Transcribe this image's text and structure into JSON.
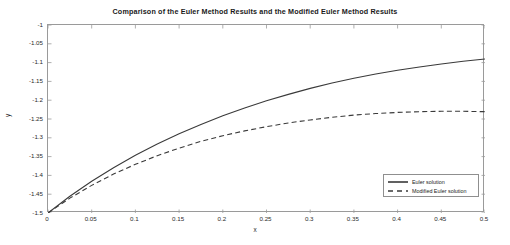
{
  "chart_data": {
    "type": "line",
    "title": "Comparison of the Euler Method Results and the Modified Euler Method Results",
    "xlabel": "x",
    "ylabel": "y",
    "xlim": [
      0,
      0.5
    ],
    "ylim": [
      -1.5,
      -1
    ],
    "grid": false,
    "legend_position": "lower-right",
    "xticks": [
      "0",
      "0.05",
      "0.1",
      "0.15",
      "0.2",
      "0.25",
      "0.3",
      "0.35",
      "0.4",
      "0.45",
      "0.5"
    ],
    "xtick_values": [
      0,
      0.05,
      0.1,
      0.15,
      0.2,
      0.25,
      0.3,
      0.35,
      0.4,
      0.45,
      0.5
    ],
    "yticks": [
      "-1",
      "-1.05",
      "-1.1",
      "-1.15",
      "-1.2",
      "-1.25",
      "-1.3",
      "-1.35",
      "-1.4",
      "-1.45",
      "-1.5"
    ],
    "ytick_values": [
      -1,
      -1.05,
      -1.1,
      -1.15,
      -1.2,
      -1.25,
      -1.3,
      -1.35,
      -1.4,
      -1.45,
      -1.5
    ],
    "x": [
      0,
      0.025,
      0.05,
      0.075,
      0.1,
      0.125,
      0.15,
      0.175,
      0.2,
      0.225,
      0.25,
      0.275,
      0.3,
      0.325,
      0.35,
      0.375,
      0.4,
      0.425,
      0.45,
      0.475,
      0.5
    ],
    "series": [
      {
        "name": "Euler solution",
        "style": "solid",
        "color": "#3a3a3a",
        "values": [
          -1.5,
          -1.4555,
          -1.4155,
          -1.3795,
          -1.3465,
          -1.3165,
          -1.2895,
          -1.2645,
          -1.2415,
          -1.2205,
          -1.2015,
          -1.1845,
          -1.1685,
          -1.1545,
          -1.1415,
          -1.1305,
          -1.1205,
          -1.1115,
          -1.1035,
          -1.0965,
          -1.0905
        ]
      },
      {
        "name": "Modified Euler solution",
        "style": "dashed",
        "color": "#3a3a3a",
        "values": [
          -1.5,
          -1.4605,
          -1.4265,
          -1.3965,
          -1.3705,
          -1.3475,
          -1.3275,
          -1.3095,
          -1.2945,
          -1.2815,
          -1.2705,
          -1.2605,
          -1.2525,
          -1.2455,
          -1.2395,
          -1.2355,
          -1.2325,
          -1.2305,
          -1.2295,
          -1.2295,
          -1.2305
        ]
      }
    ]
  },
  "legend": {
    "entries": [
      {
        "label": "Euler solution"
      },
      {
        "label": "Modified Euler solution"
      }
    ]
  }
}
